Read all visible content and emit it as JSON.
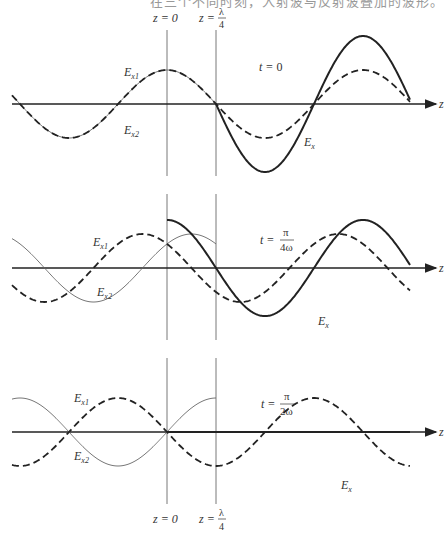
{
  "header": {
    "cut_off_text": "在三个不同时刻，入射波与反射波叠加的波形。"
  },
  "markers": {
    "z0": "z = 0",
    "zq_prefix": "z =",
    "zq_num": "λ",
    "zq_den": "4"
  },
  "axis_label": "z",
  "labels": {
    "ex1_main": "E",
    "ex1_sub": "x1",
    "ex2_main": "E",
    "ex2_sub": "x2",
    "ex_main": "E",
    "ex_sub": "x"
  },
  "panels": [
    {
      "id": "t0",
      "time_prefix": "t = ",
      "time_simple": "0",
      "time_num": "",
      "time_den": "",
      "phase_fraction_of_period": 0
    },
    {
      "id": "t_pi_4w",
      "time_prefix": "t =",
      "time_simple": "",
      "time_num": "π",
      "time_den": "4ω",
      "phase_fraction_of_period": 0.125
    },
    {
      "id": "t_pi_2w",
      "time_prefix": "t =",
      "time_simple": "",
      "time_num": "π",
      "time_den": "2ω",
      "phase_fraction_of_period": 0.25
    }
  ],
  "legend_semantics": {
    "ex1": "incident wave (dashed)",
    "ex2": "reflected wave (thin solid)",
    "ex": "total field (bold solid)"
  },
  "colors": {
    "ink": "#222222",
    "thin": "#666666",
    "guide": "#555555"
  }
}
